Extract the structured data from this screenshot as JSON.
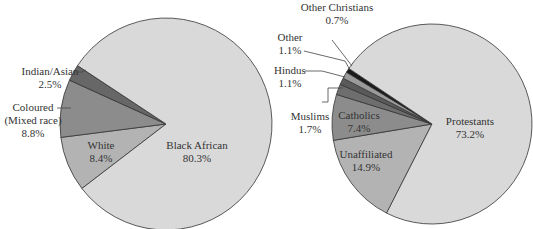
{
  "chart_data": [
    {
      "type": "pie",
      "title": "",
      "slices": [
        {
          "label": "Black African",
          "value": 80.3,
          "value_label": "80.3%",
          "color": "#d9d9d9"
        },
        {
          "label": "White",
          "value": 8.4,
          "value_label": "8.4%",
          "color": "#b3b3b3"
        },
        {
          "label": "Coloured (Mixed race)",
          "label_lines": [
            "Coloured",
            "(Mixed race)"
          ],
          "value": 8.8,
          "value_label": "8.8%",
          "color": "#8c8c8c"
        },
        {
          "label": "Indian/Asian",
          "value": 2.5,
          "value_label": "2.5%",
          "color": "#676767"
        }
      ]
    },
    {
      "type": "pie",
      "title": "",
      "slices": [
        {
          "label": "Protestants",
          "value": 73.2,
          "value_label": "73.2%",
          "color": "#d9d9d9"
        },
        {
          "label": "Unaffiliated",
          "value": 14.9,
          "value_label": "14.9%",
          "color": "#b3b3b3"
        },
        {
          "label": "Catholics",
          "value": 7.4,
          "value_label": "7.4%",
          "color": "#8c8c8c"
        },
        {
          "label": "Muslims",
          "value": 1.7,
          "value_label": "1.7%",
          "color": "#6e6e6e"
        },
        {
          "label": "Hindus",
          "value": 1.1,
          "value_label": "1.1%",
          "color": "#5a5a5a"
        },
        {
          "label": "Other",
          "value": 1.1,
          "value_label": "1.1%",
          "color": "#9a9a9a"
        },
        {
          "label": "Other Christians",
          "value": 0.7,
          "value_label": "0.7%",
          "color": "#1a1a1a"
        }
      ]
    }
  ]
}
